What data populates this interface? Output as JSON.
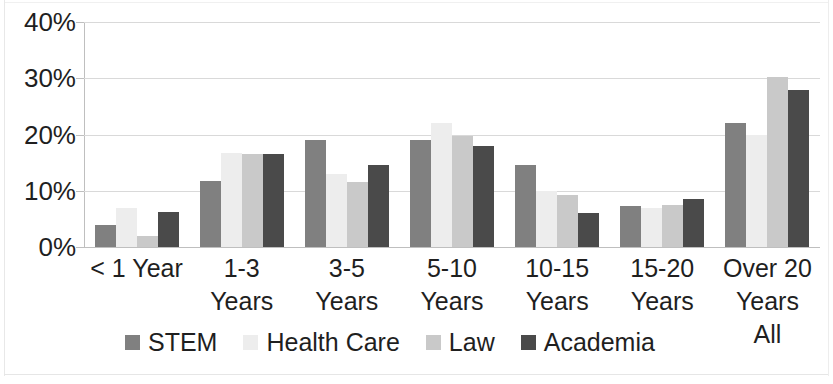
{
  "chart_data": {
    "type": "bar",
    "title": "",
    "subtitle": "",
    "xlabel": "",
    "ylabel": "",
    "ylim": [
      0,
      40
    ],
    "y_unit": "%",
    "grid": true,
    "legend_position": "bottom",
    "y_ticks": [
      "0%",
      "10%",
      "20%",
      "30%",
      "40%"
    ],
    "y_tick_values": [
      0,
      10,
      20,
      30,
      40
    ],
    "categories": [
      "< 1 Year",
      "1-3 Years",
      "3-5 Years",
      "5-10 Years",
      "10-15 Years",
      "15-20 Years",
      "Over 20 Years"
    ],
    "category_lines": [
      [
        "< 1 Year"
      ],
      [
        "1-3",
        "Years"
      ],
      [
        "3-5",
        "Years"
      ],
      [
        "5-10",
        "Years"
      ],
      [
        "10-15",
        "Years"
      ],
      [
        "15-20",
        "Years"
      ],
      [
        "Over 20",
        "Years",
        "All"
      ]
    ],
    "series": [
      {
        "name": "STEM",
        "color": "#808080",
        "values": [
          4.0,
          11.8,
          19.0,
          19.0,
          14.5,
          7.3,
          22.0
        ]
      },
      {
        "name": "Health Care",
        "color": "#ededed",
        "values": [
          7.0,
          16.7,
          13.0,
          22.0,
          10.0,
          7.0,
          20.0
        ]
      },
      {
        "name": "Law",
        "color": "#c9c9c9",
        "values": [
          2.0,
          16.6,
          11.5,
          19.7,
          9.3,
          7.5,
          30.2
        ]
      },
      {
        "name": "Academia",
        "color": "#4a4a4a",
        "values": [
          6.2,
          16.6,
          14.5,
          18.0,
          6.0,
          8.6,
          28.0
        ]
      }
    ],
    "legend": [
      {
        "label": "STEM",
        "color": "#808080"
      },
      {
        "label": "Health Care",
        "color": "#ededed"
      },
      {
        "label": "Law",
        "color": "#c9c9c9"
      },
      {
        "label": "Academia",
        "color": "#4a4a4a"
      }
    ]
  }
}
